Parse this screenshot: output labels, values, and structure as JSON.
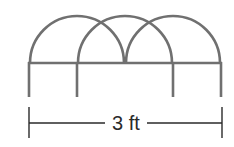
{
  "diagram": {
    "stroke_color": "#707070",
    "dimension_color": "#2a2a2a",
    "dimension_label": "3 ft",
    "posts_x": [
      29,
      77,
      173,
      221
    ],
    "rail_y": 63,
    "post_bottom_y": 97,
    "arcs": [
      {
        "cx": 77,
        "r": 47
      },
      {
        "cx": 125,
        "r": 47
      },
      {
        "cx": 173,
        "r": 47
      }
    ],
    "dimension_line": {
      "x1": 29,
      "x2": 222,
      "y": 123,
      "tick_top": 107,
      "tick_bottom": 138
    }
  }
}
